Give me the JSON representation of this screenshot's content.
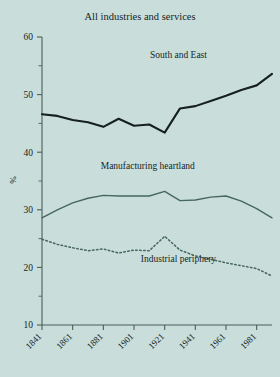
{
  "chart_data": {
    "type": "line",
    "title": "All industries and services",
    "xlabel": "",
    "ylabel": "%",
    "xlim": [
      1841,
      1991
    ],
    "ylim": [
      10,
      60
    ],
    "grid": false,
    "legend_position": "inline-annotations",
    "x_ticks": [
      1841,
      1861,
      1881,
      1901,
      1921,
      1941,
      1961,
      1981
    ],
    "x_tick_labels": [
      "1841",
      "1861",
      "1881",
      "1901",
      "1921",
      "1941",
      "1961",
      "1981"
    ],
    "y_ticks": [
      10,
      20,
      30,
      40,
      50,
      60
    ],
    "y_tick_labels": [
      "10",
      "20",
      "30",
      "40",
      "50",
      "60"
    ],
    "y_minor_ticks": [
      15,
      25,
      35,
      45,
      55
    ],
    "x": [
      1841,
      1851,
      1861,
      1871,
      1881,
      1891,
      1901,
      1911,
      1921,
      1931,
      1941,
      1951,
      1961,
      1971,
      1981,
      1991
    ],
    "series": [
      {
        "name": "South and East",
        "style": "solid",
        "color": "#16201d",
        "width": 2.1,
        "label_x": 1930,
        "label_y": 56.4,
        "values": [
          46.6,
          46.3,
          45.6,
          45.2,
          44.4,
          45.8,
          44.6,
          44.8,
          43.4,
          47.6,
          48.0,
          48.9,
          49.8,
          50.8,
          51.6,
          53.6
        ]
      },
      {
        "name": "Manufacturing heartland",
        "style": "solid",
        "color": "#46665e",
        "width": 1.4,
        "label_x": 1910,
        "label_y": 37.0,
        "values": [
          28.6,
          30.0,
          31.2,
          32.0,
          32.5,
          32.4,
          32.4,
          32.4,
          33.2,
          31.6,
          31.7,
          32.2,
          32.4,
          31.5,
          30.2,
          28.6
        ]
      },
      {
        "name": "Industrial periphery",
        "style": "dotted",
        "color": "#46665e",
        "width": 1.5,
        "label_x": 1930,
        "label_y": 21.0,
        "values": [
          24.9,
          24.0,
          23.4,
          22.9,
          23.2,
          22.5,
          23.0,
          22.9,
          25.4,
          23.0,
          22.0,
          21.4,
          20.8,
          20.3,
          19.8,
          18.5
        ]
      }
    ]
  },
  "colors": {
    "background": "#c9dedb",
    "axis": "#4a5f5a",
    "text": "#15251f",
    "south_and_east": "#16201d",
    "manufacturing_heartland": "#46665e",
    "industrial_periphery": "#46665e"
  }
}
